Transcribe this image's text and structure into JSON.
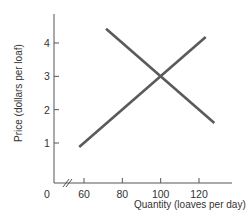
{
  "chart_data": {
    "type": "line",
    "title": "",
    "xlabel": "Quantity (loaves per day)",
    "ylabel": "Price (dollars per loaf)",
    "x_ticks": [
      60,
      80,
      100,
      120
    ],
    "y_ticks": [
      1,
      2,
      3,
      4
    ],
    "origin_label": "0",
    "x_axis_break": true,
    "xlim": [
      50,
      135
    ],
    "ylim": [
      0,
      5
    ],
    "grid": false,
    "legend": "none",
    "series": [
      {
        "name": "Demand",
        "points": [
          [
            71.5,
            4.43
          ],
          [
            128,
            1.6
          ]
        ]
      },
      {
        "name": "Supply",
        "points": [
          [
            57.5,
            0.88
          ],
          [
            123.5,
            4.18
          ]
        ]
      }
    ],
    "equilibrium": {
      "quantity": 100,
      "price": 3
    },
    "line_color": "#5a5a5a",
    "axis_color": "#555555"
  }
}
